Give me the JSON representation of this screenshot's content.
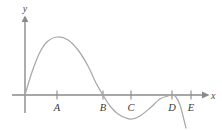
{
  "figure": {
    "title": "",
    "background_color": "#ffffff",
    "curve_color": "#a8a8a8",
    "axis_color": "#8a8a8a",
    "label_color": "#3a3a3a"
  },
  "axes": {
    "x_label": "x",
    "y_label": "y",
    "x_axis_y_px": 95,
    "y_axis_x_px": 25,
    "x_axis_start_px": 12,
    "x_axis_end_px": 207,
    "y_axis_top_px": 18,
    "y_axis_bottom_px": 113,
    "arrows": [
      "x-axis-arrow",
      "y-axis-arrow"
    ]
  },
  "ticks": [
    {
      "label": "A",
      "x_px": 57
    },
    {
      "label": "B",
      "x_px": 103
    },
    {
      "label": "C",
      "x_px": 131
    },
    {
      "label": "D",
      "x_px": 172
    },
    {
      "label": "E",
      "x_px": 191
    }
  ],
  "chart_data": {
    "type": "line",
    "title": "",
    "xlabel": "x",
    "ylabel": "y",
    "grid": false,
    "legend": "none",
    "x_tick_labels": [
      "A",
      "B",
      "C",
      "D",
      "E"
    ],
    "y_tick_labels": [],
    "features": [
      {
        "name": "origin-root",
        "x_label": "O",
        "x_px": 25,
        "y_px": 95,
        "kind": "x-intercept"
      },
      {
        "name": "local-maximum",
        "x_label": "near A",
        "x_px": 58,
        "y_px": 37,
        "kind": "maximum"
      },
      {
        "name": "root-at-B",
        "x_label": "B",
        "x_px": 103,
        "y_px": 95,
        "kind": "x-intercept"
      },
      {
        "name": "local-minimum",
        "x_label": "between C and D",
        "x_px": 130,
        "y_px": 119,
        "kind": "minimum"
      },
      {
        "name": "tangent-root-at-D",
        "x_label": "D",
        "x_px": 172,
        "y_px": 95,
        "kind": "tangential-x-intercept"
      },
      {
        "name": "tail-descending",
        "x_label": "past E",
        "x_px": 186,
        "y_px": 128,
        "kind": "endpoint"
      }
    ],
    "x": [
      25,
      32,
      40,
      48,
      58,
      68,
      78,
      88,
      96,
      103,
      110,
      118,
      126,
      132,
      140,
      150,
      160,
      168,
      172,
      176,
      180,
      183,
      186
    ],
    "y": [
      95,
      72,
      52,
      41,
      37,
      40,
      50,
      66,
      83,
      95,
      106,
      114,
      118,
      119,
      116,
      108,
      99,
      96,
      95,
      97,
      105,
      116,
      128
    ]
  }
}
